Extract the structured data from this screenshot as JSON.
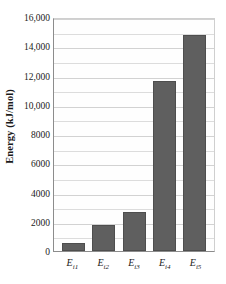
{
  "chart_data": {
    "type": "bar",
    "title": "",
    "xlabel": "",
    "ylabel": "Energy (kJ/mol)",
    "categories": [
      "Ei1",
      "Ei2",
      "Ei3",
      "Ei4",
      "Ei5"
    ],
    "category_labels": [
      {
        "base": "E",
        "sub": "i1"
      },
      {
        "base": "E",
        "sub": "i2"
      },
      {
        "base": "E",
        "sub": "i3"
      },
      {
        "base": "E",
        "sub": "i4"
      },
      {
        "base": "E",
        "sub": "i5"
      }
    ],
    "values": [
      580,
      1800,
      2700,
      11600,
      14800
    ],
    "ylim": [
      0,
      16000
    ],
    "ytick_values": [
      0,
      2000,
      4000,
      6000,
      8000,
      10000,
      12000,
      14000,
      16000
    ],
    "ytick_labels": [
      "0",
      "2000",
      "4000",
      "6000",
      "8000",
      "10,000",
      "12,000",
      "14,000",
      "16,000"
    ],
    "minor_gridline_step": 1000,
    "grid": true,
    "legend": false,
    "bar_color": "#5f5f5f",
    "bar_edge_color": "#4e4e4e",
    "gridline_color": "#dcdcdc",
    "axis_color": "#8c8c8c",
    "background_color": "#ffffff"
  }
}
